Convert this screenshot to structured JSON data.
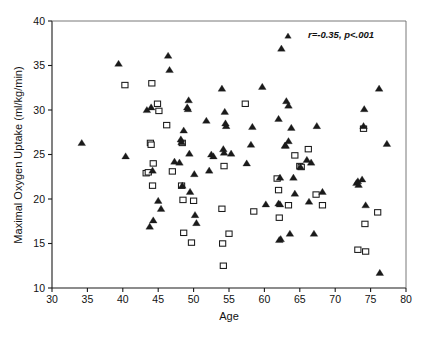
{
  "chart_data": {
    "type": "scatter",
    "title": "",
    "xlabel": "Age",
    "ylabel": "Maximal Oxygen Uptake (ml/kg/min)",
    "xlim": [
      30,
      80
    ],
    "ylim": [
      10,
      40
    ],
    "xticks": [
      30,
      35,
      40,
      45,
      50,
      55,
      60,
      65,
      70,
      75,
      80
    ],
    "yticks": [
      10,
      15,
      20,
      25,
      30,
      35,
      40
    ],
    "grid": false,
    "legend": "none",
    "annotations": [
      {
        "text": "r=-0.35, p<.001",
        "x": 69.5,
        "y": 38.6,
        "style": "bold-italic"
      }
    ],
    "series": [
      {
        "name": "filled-triangle",
        "marker": "triangle",
        "fill": "#1a1a1a",
        "points": [
          [
            34.2,
            26.3
          ],
          [
            39.4,
            35.2
          ],
          [
            40.4,
            24.8
          ],
          [
            43.4,
            30.0
          ],
          [
            44.0,
            30.3
          ],
          [
            44.2,
            23.2
          ],
          [
            43.8,
            16.9
          ],
          [
            44.3,
            17.6
          ],
          [
            45.0,
            19.8
          ],
          [
            45.4,
            18.9
          ],
          [
            46.4,
            36.1
          ],
          [
            46.6,
            34.5
          ],
          [
            47.3,
            24.2
          ],
          [
            48.0,
            24.1
          ],
          [
            48.2,
            26.7
          ],
          [
            48.3,
            26.4
          ],
          [
            48.4,
            21.5
          ],
          [
            48.6,
            27.7
          ],
          [
            49.1,
            30.3
          ],
          [
            49.3,
            31.1
          ],
          [
            49.2,
            30.1
          ],
          [
            49.4,
            25.1
          ],
          [
            49.5,
            20.8
          ],
          [
            50.1,
            22.8
          ],
          [
            50.2,
            18.2
          ],
          [
            50.4,
            17.3
          ],
          [
            51.8,
            28.8
          ],
          [
            52.2,
            23.2
          ],
          [
            52.5,
            25.0
          ],
          [
            52.8,
            24.8
          ],
          [
            54.0,
            32.4
          ],
          [
            54.2,
            25.6
          ],
          [
            54.3,
            25.2
          ],
          [
            54.4,
            29.8
          ],
          [
            54.5,
            28.5
          ],
          [
            54.6,
            28.2
          ],
          [
            55.3,
            25.1
          ],
          [
            57.5,
            24.0
          ],
          [
            58.1,
            26.1
          ],
          [
            58.3,
            28.1
          ],
          [
            59.7,
            32.6
          ],
          [
            60.2,
            19.4
          ],
          [
            62.0,
            19.5
          ],
          [
            62.2,
            19.4
          ],
          [
            62.1,
            15.4
          ],
          [
            62.3,
            15.5
          ],
          [
            62.2,
            22.4
          ],
          [
            62.0,
            29.0
          ],
          [
            62.4,
            36.9
          ],
          [
            62.9,
            26.0
          ],
          [
            63.0,
            26.0
          ],
          [
            63.1,
            31.0
          ],
          [
            63.4,
            30.5
          ],
          [
            63.4,
            26.5
          ],
          [
            63.6,
            16.1
          ],
          [
            63.8,
            28.0
          ],
          [
            64.1,
            22.4
          ],
          [
            64.3,
            20.6
          ],
          [
            65.1,
            23.6
          ],
          [
            66.0,
            24.4
          ],
          [
            66.3,
            19.7
          ],
          [
            66.6,
            24.1
          ],
          [
            67.0,
            16.1
          ],
          [
            67.4,
            28.2
          ],
          [
            68.2,
            20.8
          ],
          [
            73.0,
            21.8
          ],
          [
            73.2,
            22.0
          ],
          [
            73.3,
            21.6
          ],
          [
            73.8,
            22.2
          ],
          [
            74.0,
            28.2
          ],
          [
            74.1,
            30.1
          ],
          [
            74.3,
            19.3
          ],
          [
            76.2,
            32.4
          ],
          [
            76.3,
            11.7
          ],
          [
            77.3,
            26.2
          ]
        ]
      },
      {
        "name": "open-square",
        "marker": "square",
        "fill": "#ffffff",
        "points": [
          [
            40.3,
            32.8
          ],
          [
            43.3,
            22.9
          ],
          [
            43.6,
            23.0
          ],
          [
            43.9,
            26.3
          ],
          [
            44.0,
            26.1
          ],
          [
            44.1,
            33.0
          ],
          [
            44.2,
            21.5
          ],
          [
            44.3,
            24.0
          ],
          [
            44.9,
            30.7
          ],
          [
            45.1,
            29.9
          ],
          [
            46.2,
            28.3
          ],
          [
            47.0,
            23.1
          ],
          [
            48.3,
            21.5
          ],
          [
            48.4,
            26.3
          ],
          [
            48.5,
            19.9
          ],
          [
            48.6,
            16.2
          ],
          [
            49.7,
            15.1
          ],
          [
            50.0,
            19.8
          ],
          [
            54.0,
            18.9
          ],
          [
            54.1,
            15.0
          ],
          [
            54.3,
            23.7
          ],
          [
            54.2,
            12.5
          ],
          [
            55.0,
            16.1
          ],
          [
            57.3,
            30.7
          ],
          [
            58.5,
            18.6
          ],
          [
            61.8,
            22.3
          ],
          [
            62.0,
            21.0
          ],
          [
            62.1,
            17.9
          ],
          [
            63.4,
            19.3
          ],
          [
            64.3,
            24.9
          ],
          [
            65.0,
            23.7
          ],
          [
            65.2,
            23.6
          ],
          [
            66.2,
            25.6
          ],
          [
            67.3,
            20.5
          ],
          [
            68.2,
            19.3
          ],
          [
            73.2,
            14.3
          ],
          [
            74.0,
            27.9
          ],
          [
            74.2,
            17.2
          ],
          [
            74.3,
            14.1
          ],
          [
            76.0,
            18.5
          ]
        ]
      }
    ]
  },
  "axes": {
    "x_title": "Age",
    "y_title": "Maximal Oxygen Uptake (ml/kg/min)",
    "x_tick_labels": [
      "30",
      "35",
      "40",
      "45",
      "50",
      "55",
      "60",
      "65",
      "70",
      "75",
      "80"
    ],
    "y_tick_labels": [
      "10",
      "15",
      "20",
      "25",
      "30",
      "35",
      "40"
    ]
  },
  "annotation": {
    "stats_text": "r=-0.35, p<.001"
  },
  "colors": {
    "marker_fill": "#1a1a1a",
    "marker_open": "#ffffff",
    "axis": "#1a1a1a",
    "frame": "#6a6a6a",
    "background": "#ffffff"
  }
}
